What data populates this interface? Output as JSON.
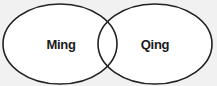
{
  "diagram": {
    "type": "venn",
    "background": "#f1f1f1",
    "stroke_color": "#222222",
    "fill_color": "#ffffff",
    "sets": [
      {
        "id": "ming",
        "label": "Ming",
        "cx": 60,
        "cy": 44,
        "rx": 57,
        "ry": 40
      },
      {
        "id": "qing",
        "label": "Qing",
        "cx": 155,
        "cy": 44,
        "rx": 57,
        "ry": 40
      }
    ],
    "intersection_label": ""
  }
}
